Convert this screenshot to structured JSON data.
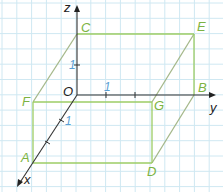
{
  "diagram": {
    "type": "3d-coordinate-box",
    "colors": {
      "grid": "#cfe8f2",
      "box": "#9ccc65",
      "box_dashed": "#9ccc65",
      "axis": "#333333",
      "axis_unit_tick": "#1e88c8",
      "vertex_label": "#7cb342",
      "axis_label": "#222222",
      "unit_label": "#5a9fd4"
    },
    "axes": {
      "x_label": "x",
      "y_label": "y",
      "z_label": "z",
      "origin_label": "O"
    },
    "unit_labels": {
      "z": "1",
      "y": "1",
      "x": "1"
    },
    "vertices": {
      "A": "A",
      "B": "B",
      "C": "C",
      "D": "D",
      "E": "E",
      "F": "F",
      "G": "G"
    }
  }
}
